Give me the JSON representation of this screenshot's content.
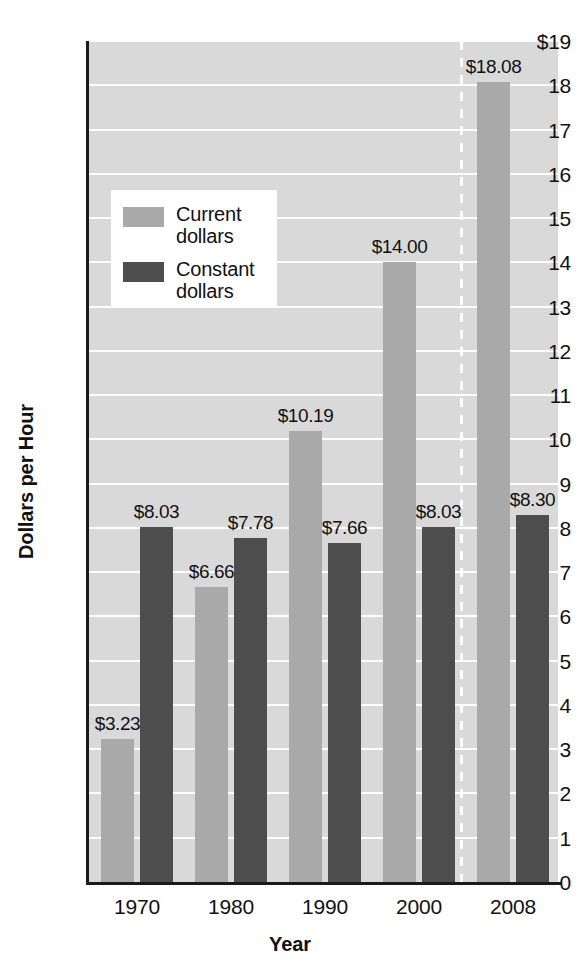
{
  "chart_data": {
    "type": "bar",
    "title": "",
    "xlabel": "Year",
    "ylabel": "Dollars per Hour",
    "categories": [
      "1970",
      "1980",
      "1990",
      "2000",
      "2008"
    ],
    "ylim": [
      0,
      19
    ],
    "ytick_values": [
      0,
      1,
      2,
      3,
      4,
      5,
      6,
      7,
      8,
      9,
      10,
      11,
      12,
      13,
      14,
      15,
      16,
      17,
      18,
      19
    ],
    "ytick_labels": [
      "0",
      "1",
      "2",
      "3",
      "4",
      "5",
      "6",
      "7",
      "8",
      "9",
      "10",
      "11",
      "12",
      "13",
      "14",
      "15",
      "16",
      "17",
      "18",
      "$19"
    ],
    "grid": true,
    "legend_position": "upper-left-inside",
    "series": [
      {
        "name": "Current dollars",
        "color": "#a9a9a9",
        "values": [
          3.23,
          6.66,
          10.19,
          14.0,
          18.08
        ],
        "labels": [
          "$3.23",
          "$6.66",
          "$10.19",
          "$14.00",
          "$18.08"
        ]
      },
      {
        "name": "Constant dollars",
        "color": "#4d4d4d",
        "values": [
          8.03,
          7.78,
          7.66,
          8.03,
          8.3
        ],
        "labels": [
          "$8.03",
          "$7.78",
          "$7.66",
          "$8.03",
          "$8.30"
        ]
      }
    ],
    "annotations": [
      {
        "type": "vertical-dashed-line",
        "between": [
          "2000",
          "2008"
        ],
        "color": "#ffffff"
      }
    ]
  },
  "legend": {
    "items": [
      {
        "label_line1": "Current",
        "label_line2": "dollars",
        "swatch": "current"
      },
      {
        "label_line1": "Constant",
        "label_line2": "dollars",
        "swatch": "constant"
      }
    ]
  },
  "axes": {
    "y_title": "Dollars per Hour",
    "x_title": "Year"
  }
}
